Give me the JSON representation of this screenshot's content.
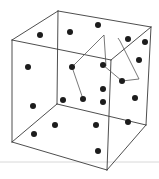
{
  "diagram": {
    "type": "3d-scatter-cube",
    "colors": {
      "background": "#ffffff",
      "edge": "#3a3a3a",
      "path": "#555555",
      "dot": "#1c1c1c",
      "baseline": "#d8d8d8"
    },
    "cube_vertices": {
      "back_top_left": [
        58,
        11
      ],
      "back_top_right": [
        151,
        27
      ],
      "back_bottom_left": [
        57,
        104
      ],
      "back_bottom_right": [
        146,
        125
      ],
      "front_top_left": [
        12,
        40
      ],
      "front_top_right": [
        111,
        60
      ],
      "front_bottom_left": [
        12,
        142
      ],
      "front_bottom_right": [
        107,
        170
      ]
    },
    "dots": [
      [
        40,
        35
      ],
      [
        70,
        32
      ],
      [
        98,
        25
      ],
      [
        128,
        39
      ],
      [
        145,
        42
      ],
      [
        139,
        60
      ],
      [
        28,
        67
      ],
      [
        72,
        67
      ],
      [
        103,
        65
      ],
      [
        122,
        81
      ],
      [
        103,
        89
      ],
      [
        135,
        98
      ],
      [
        33,
        106
      ],
      [
        63,
        100
      ],
      [
        83,
        99
      ],
      [
        103,
        102
      ],
      [
        55,
        125
      ],
      [
        96,
        125
      ],
      [
        128,
        122
      ],
      [
        34,
        134
      ],
      [
        98,
        151
      ]
    ],
    "paths": [
      [
        [
          83,
          99
        ],
        [
          72,
          67
        ],
        [
          104,
          35
        ],
        [
          106,
          66
        ]
      ],
      [
        [
          103,
          65
        ],
        [
          122,
          81
        ],
        [
          139,
          79
        ],
        [
          120,
          41
        ]
      ],
      [
        [
          118,
          38
        ],
        [
          120,
          41
        ]
      ]
    ],
    "baseline_y": 162
  }
}
